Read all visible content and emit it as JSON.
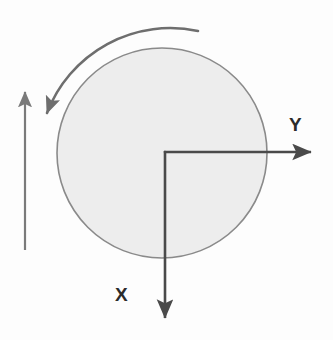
{
  "figure": {
    "kind": "engineering-sketch",
    "background_color": "#fdfdfd",
    "width": 333,
    "height": 340
  },
  "disk": {
    "name": "rotating-disk",
    "center": {
      "x": 162,
      "y": 153
    },
    "radius": 105,
    "fill_color": "#ededed",
    "stroke_color": "#8a8a8a",
    "stroke_width": 1.6
  },
  "rotation_arrow": {
    "name": "counter-clockwise-rotation-arrow",
    "direction": "counter-clockwise",
    "stroke_color": "#6e6e6e",
    "stroke_width": 2.6,
    "tail": {
      "x": 198,
      "y": 31
    },
    "head": {
      "x": 45,
      "y": 118
    },
    "sweep_radius": 132
  },
  "translation_arrow": {
    "name": "upward-translation-arrow",
    "direction": "up",
    "stroke_color": "#7a7a7a",
    "stroke_width": 2.2,
    "tail": {
      "x": 25,
      "y": 250
    },
    "head": {
      "x": 25,
      "y": 88
    }
  },
  "axes": {
    "origin": {
      "x": 165,
      "y": 152
    },
    "stroke_color": "#4a4a4a",
    "stroke_width": 2.6,
    "y_axis": {
      "label": "Y",
      "direction": "right",
      "tip": {
        "x": 318,
        "y": 152
      }
    },
    "x_axis": {
      "label": "X",
      "direction": "down",
      "tip": {
        "x": 165,
        "y": 325
      }
    }
  },
  "colors": {
    "disk_fill": "#ededed",
    "disk_stroke": "#8a8a8a",
    "axis": "#4a4a4a",
    "rotation_arrow": "#6e6e6e",
    "translation_arrow": "#7a7a7a",
    "label_text": "#2b2b2b"
  }
}
